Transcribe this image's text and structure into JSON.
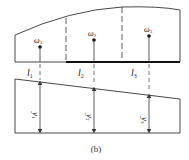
{
  "figure": {
    "caption": "(b)",
    "colors": {
      "line": "#333333",
      "background": "#ffffff"
    },
    "top_region": {
      "labels": [
        {
          "sym": "ω",
          "sub": "1"
        },
        {
          "sym": "ω",
          "sub": "2"
        },
        {
          "sym": "ω",
          "sub": "3"
        }
      ],
      "intervals": [
        {
          "sym": "l",
          "sub": "1"
        },
        {
          "sym": "l",
          "sub": "2"
        },
        {
          "sym": "l",
          "sub": "3"
        }
      ]
    },
    "bottom_region": {
      "ordinates": [
        {
          "sym": "y",
          "sub": "1"
        },
        {
          "sym": "y",
          "sub": "2"
        },
        {
          "sym": "y",
          "sub": "3"
        }
      ]
    }
  }
}
